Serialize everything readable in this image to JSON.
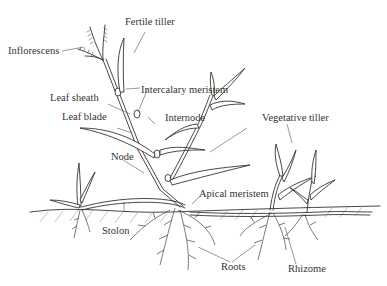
{
  "diagram": {
    "type": "labeled botanical illustration",
    "labels": [
      {
        "id": "fertile-tiller",
        "text": "Fertile tiller"
      },
      {
        "id": "inflorescens",
        "text": "Inflorescens"
      },
      {
        "id": "intercalary-meristem",
        "text": "Intercalary meristem"
      },
      {
        "id": "leaf-sheath",
        "text": "Leaf sheath"
      },
      {
        "id": "leaf-blade",
        "text": "Leaf blade"
      },
      {
        "id": "internode",
        "text": "Internode"
      },
      {
        "id": "vegetative-tiller",
        "text": "Vegetative tiller"
      },
      {
        "id": "node",
        "text": "Node"
      },
      {
        "id": "apical-meristem",
        "text": "Apical meristem"
      },
      {
        "id": "stolon",
        "text": "Stolon"
      },
      {
        "id": "roots",
        "text": "Roots"
      },
      {
        "id": "rhizome",
        "text": "Rhizome"
      }
    ]
  }
}
